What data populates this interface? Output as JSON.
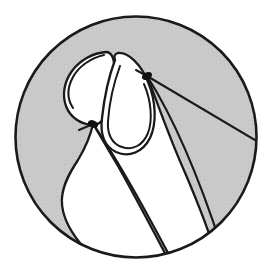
{
  "figure": {
    "description": "Circular vignette line drawing of a thumb and index fingertip pinching, rendered as white shapes over a light gray field with black contour strokes.",
    "domain": "illustration",
    "canvas": {
      "width": 271,
      "height": 276
    },
    "colors": {
      "page_background": "#ffffff",
      "circle_fill_gray": "#c9c9c9",
      "shape_fill_white": "#ffffff",
      "stroke_black": "#1a1a1a",
      "knot_black": "#111111"
    },
    "frame": {
      "shape": "circle",
      "center_x": 136,
      "center_y": 137,
      "radius": 121,
      "stroke_width": 2.6
    },
    "elements": [
      {
        "name": "circular-frame",
        "label": "Circular vignette border"
      },
      {
        "name": "gray-field",
        "label": "Light gray background field"
      },
      {
        "name": "index-fingertip",
        "label": "Index fingertip (upper right white lobe)"
      },
      {
        "name": "thumb-fingertip",
        "label": "Thumb fingertip (upper left white lobe)"
      },
      {
        "name": "index-finger-body",
        "label": "Index finger body extending to lower right"
      },
      {
        "name": "hand-contour",
        "label": "Wavy hand contour on the lower left"
      },
      {
        "name": "upper-contact-knot",
        "label": "Upper contact point marker"
      },
      {
        "name": "lower-contact-knot",
        "label": "Lower contact point marker"
      },
      {
        "name": "ray-upper",
        "label": "Upper ray line fanning to the right edge"
      },
      {
        "name": "ray-lower",
        "label": "Lower ray line fanning to the bottom right"
      }
    ],
    "markers": [
      {
        "name": "upper-contact-knot",
        "x": 147,
        "y": 76
      },
      {
        "name": "lower-contact-knot",
        "x": 93,
        "y": 124
      }
    ]
  }
}
